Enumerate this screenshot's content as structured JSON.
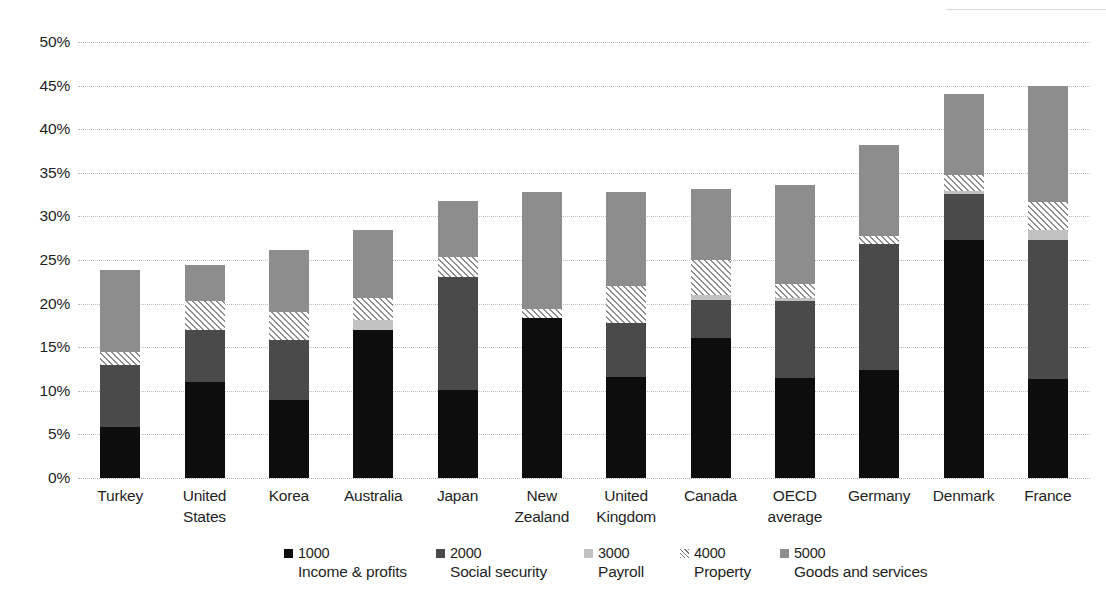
{
  "chart_data": {
    "type": "bar",
    "subtype": "stacked-vertical",
    "title": "",
    "subtitle": "",
    "xlabel": "",
    "ylabel": "",
    "ylim": [
      0,
      50
    ],
    "ytick_step": 5,
    "ytick_suffix": "%",
    "ytick_labels": [
      "0%",
      "5%",
      "10%",
      "15%",
      "20%",
      "25%",
      "30%",
      "35%",
      "40%",
      "45%",
      "50%"
    ],
    "ytick_values": [
      0,
      5,
      10,
      15,
      20,
      25,
      30,
      35,
      40,
      45,
      50
    ],
    "grid": true,
    "grid_axis": "y",
    "legend_position": "bottom",
    "categories": [
      "Turkey",
      "United States",
      "Korea",
      "Australia",
      "Japan",
      "New Zealand",
      "United Kingdom",
      "Canada",
      "OECD average",
      "Germany",
      "Denmark",
      "France"
    ],
    "series": [
      {
        "name": "1000",
        "label": "Income & profits",
        "color": "#0d0d0d",
        "values": [
          5.8,
          11.0,
          9.0,
          17.0,
          10.1,
          18.4,
          11.6,
          16.1,
          11.5,
          12.4,
          27.3,
          11.3
        ]
      },
      {
        "name": "2000",
        "label": "Social security",
        "color": "#4a4a4a",
        "values": [
          7.2,
          6.0,
          6.8,
          0.0,
          12.9,
          0.0,
          6.2,
          4.3,
          8.8,
          14.4,
          5.3,
          16.0
        ]
      },
      {
        "name": "3000",
        "label": "Payroll",
        "color": "#c2c2c2",
        "values": [
          0.0,
          0.0,
          0.0,
          1.1,
          0.0,
          0.0,
          0.0,
          0.6,
          0.4,
          0.0,
          0.3,
          1.1
        ]
      },
      {
        "name": "4000",
        "label": "Property",
        "color": "#eeeeee",
        "hatched": true,
        "values": [
          1.4,
          3.3,
          3.2,
          2.5,
          2.4,
          1.0,
          4.2,
          4.0,
          1.6,
          1.0,
          1.8,
          3.3
        ]
      },
      {
        "name": "5000",
        "label": "Goods and services",
        "color": "#8d8d8d",
        "values": [
          9.4,
          4.1,
          7.1,
          7.9,
          6.4,
          13.4,
          10.8,
          8.1,
          11.3,
          10.4,
          9.3,
          13.3
        ]
      }
    ],
    "totals": [
      23.8,
      24.4,
      26.1,
      28.5,
      31.8,
      32.8,
      32.8,
      33.1,
      33.6,
      38.2,
      44.0,
      45.0
    ],
    "legend_entries": [
      {
        "code": "1000",
        "label": "Income & profits"
      },
      {
        "code": "2000",
        "label": "Social security"
      },
      {
        "code": "3000",
        "label": "Payroll"
      },
      {
        "code": "4000",
        "label": "Property"
      },
      {
        "code": "5000",
        "label": "Goods and services"
      }
    ]
  }
}
